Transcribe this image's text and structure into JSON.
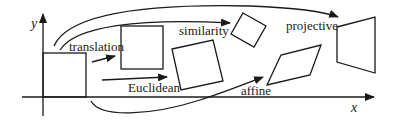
{
  "diagram": {
    "type": "2D planar transformations illustration",
    "axes": {
      "x_label": "x",
      "y_label": "y"
    },
    "labels": {
      "translation": "translation",
      "euclidean": "Euclidean",
      "similarity": "similarity",
      "affine": "affine",
      "projective": "projective"
    },
    "shapes": [
      {
        "name": "original-square",
        "transform": "identity"
      },
      {
        "name": "translated-square",
        "transform": "translation"
      },
      {
        "name": "euclidean-square",
        "transform": "Euclidean"
      },
      {
        "name": "similarity-square",
        "transform": "similarity"
      },
      {
        "name": "affine-parallelogram",
        "transform": "affine"
      },
      {
        "name": "projective-quad",
        "transform": "projective"
      }
    ],
    "colors": {
      "stroke": "#1a1a1a",
      "background": "#ffffff"
    }
  }
}
